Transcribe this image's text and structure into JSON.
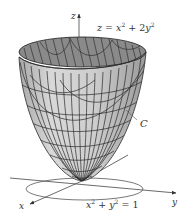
{
  "figure": {
    "type": "3d-surface-diagram",
    "surface_equation": {
      "lhs": "z",
      "eq": " = ",
      "x": "x",
      "x_exp": "2",
      "plus": " + 2",
      "y": "y",
      "y_exp": "2"
    },
    "circle_equation": {
      "x": "x",
      "x_exp": "2",
      "plus": " + ",
      "y": "y",
      "y_exp": "2",
      "rhs": " = 1"
    },
    "curve_label": "C",
    "axes": {
      "x": "x",
      "y": "y",
      "z": "z"
    },
    "colors": {
      "surface_outer": "#c8c8c8",
      "surface_inner": "#8a8a8a",
      "grid_lines": "#2a2a2a",
      "axes": "#444444",
      "circle": "#555555",
      "text": "#333333"
    }
  }
}
